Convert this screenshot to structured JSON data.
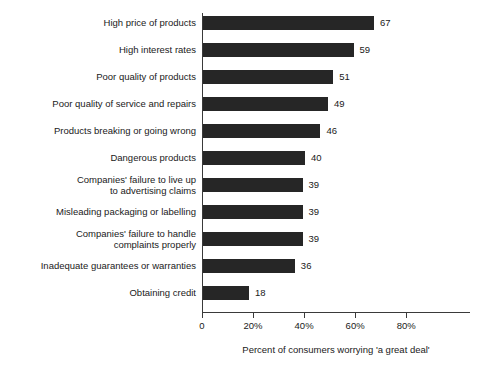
{
  "chart_data": {
    "type": "bar",
    "orientation": "horizontal",
    "title": "",
    "xlabel": "Percent of consumers worrying 'a great deal'",
    "ylabel": "",
    "xlim": [
      0,
      88
    ],
    "xticks": [
      0,
      20,
      40,
      60,
      80
    ],
    "xtick_labels": [
      "0",
      "20%",
      "40%",
      "60%",
      "80%"
    ],
    "grid": false,
    "legend": null,
    "bar_color": "#262626",
    "axis_color": "#3a3a3a",
    "categories": [
      "High price of products",
      "High interest rates",
      "Poor quality of products",
      "Poor quality of service and repairs",
      "Products breaking or going wrong",
      "Dangerous products",
      "Companies' failure to live up\nto advertising claims",
      "Misleading packaging or labelling",
      "Companies' failure to handle\ncomplaints properly",
      "Inadequate guarantees or warranties",
      "Obtaining credit"
    ],
    "values": [
      67,
      59,
      51,
      49,
      46,
      40,
      39,
      39,
      39,
      36,
      18
    ],
    "value_labels": [
      "67",
      "59",
      "51",
      "49",
      "46",
      "40",
      "39",
      "39",
      "39",
      "36",
      "18"
    ]
  }
}
